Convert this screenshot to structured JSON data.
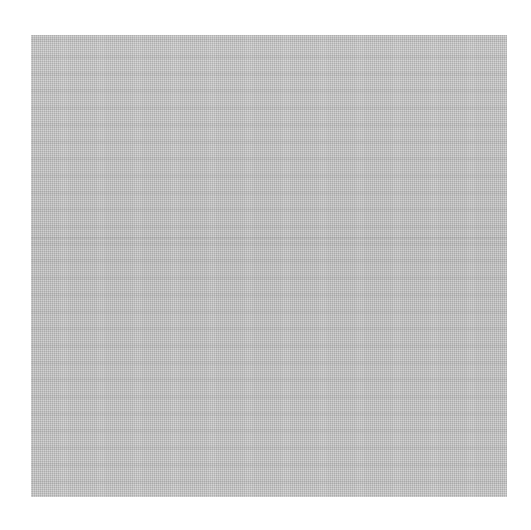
{
  "image": {
    "subject": "gray woven fabric texture swatch",
    "background_color": "#ffffff",
    "swatch_color": "#c6c6c6",
    "swatch": {
      "left": 31,
      "top": 35,
      "width": 476,
      "height": 462
    },
    "seam_offset_y": 202
  }
}
